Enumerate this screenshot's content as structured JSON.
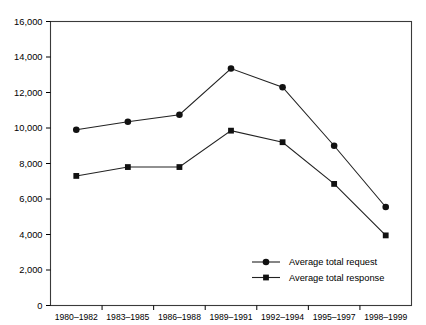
{
  "chart_data": {
    "type": "line",
    "title": "",
    "subtitle": "",
    "xlabel": "",
    "ylabel": "",
    "categories": [
      "1980–1982",
      "1983–1985",
      "1986–1988",
      "1989–1991",
      "1992–1994",
      "1995–1997",
      "1998–1999"
    ],
    "series": [
      {
        "name": "Average total request",
        "marker": "circle",
        "values": [
          9900,
          10350,
          10750,
          13350,
          12300,
          9000,
          5550
        ]
      },
      {
        "name": "Average total response",
        "marker": "square",
        "values": [
          7300,
          7800,
          7800,
          9850,
          9200,
          6850,
          3950
        ]
      }
    ],
    "ylim": [
      0,
      16000
    ],
    "ytick_values": [
      0,
      2000,
      4000,
      6000,
      8000,
      10000,
      12000,
      14000,
      16000
    ],
    "ytick_labels": [
      "0",
      "2,000",
      "4,000",
      "6,000",
      "8,000",
      "10,000",
      "12,000",
      "14,000",
      "16,000"
    ],
    "grid": false,
    "legend_position": "bottom-right",
    "legend_entries": [
      "Average total request",
      "Average total response"
    ],
    "colors": {
      "series_line": "#222222",
      "marker": "#111111",
      "frame": "#3a3a3a",
      "background": "#ffffff",
      "text": "#000000"
    }
  }
}
